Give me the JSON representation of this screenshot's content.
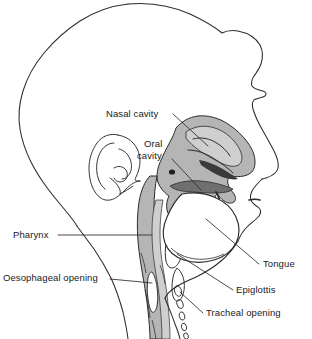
{
  "figure": {
    "background_color": "#ffffff",
    "outline_color": "#2b2b2b",
    "tissue_fill_mid": "#b5b5b5",
    "tissue_fill_light": "#cfcfcf",
    "tissue_fill_dark": "#8f8f8f",
    "cavity_fill": "#ffffff",
    "leader_line_color": "#2b2b2b"
  },
  "labels": {
    "nasal_cavity": "Nasal cavity",
    "oral_cavity_line1": "Oral",
    "oral_cavity_line2": "cavity",
    "pharynx": "Pharynx",
    "oesophageal_opening": "Oesophageal opening",
    "tongue": "Tongue",
    "epiglottis": "Epiglottis",
    "tracheal_opening": "Tracheal opening"
  },
  "structures": [
    {
      "name": "head-outline",
      "label": null
    },
    {
      "name": "ear",
      "label": null
    },
    {
      "name": "nasal-cavity",
      "label": "Nasal cavity"
    },
    {
      "name": "oral-cavity",
      "label": "Oral cavity"
    },
    {
      "name": "tongue",
      "label": "Tongue"
    },
    {
      "name": "pharynx",
      "label": "Pharynx"
    },
    {
      "name": "epiglottis",
      "label": "Epiglottis"
    },
    {
      "name": "oesophageal-opening",
      "label": "Oesophageal opening"
    },
    {
      "name": "tracheal-opening",
      "label": "Tracheal opening"
    },
    {
      "name": "vertebral-column",
      "label": null
    },
    {
      "name": "tracheal-rings",
      "label": null
    }
  ]
}
